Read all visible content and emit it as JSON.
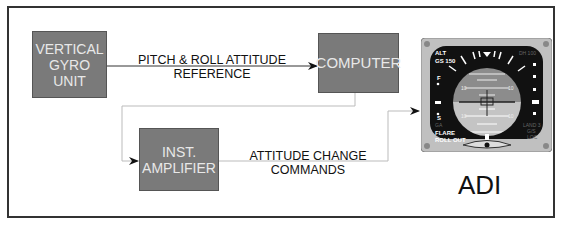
{
  "diagram": {
    "blocks": [
      {
        "id": "vgu",
        "label": "VERTICAL\nGYRO\nUNIT"
      },
      {
        "id": "computer",
        "label": "COMPUTER"
      },
      {
        "id": "amplifier",
        "label": "INST.\nAMPLIFIER"
      }
    ],
    "connections": [
      {
        "from": "vgu",
        "to": "computer",
        "label": "PITCH & ROLL ATTITUDE\nREFERENCE"
      },
      {
        "from": "computer",
        "to": "amplifier",
        "label": ""
      },
      {
        "from": "amplifier",
        "to": "adi",
        "label": "ATTITUDE CHANGE\nCOMMANDS"
      }
    ],
    "instrument": {
      "id": "adi",
      "label": "ADI",
      "readouts": {
        "top_left_1": "ALT",
        "top_left_2": "GS 150",
        "left_f": "F",
        "left_s": "S",
        "left_ga": "GA",
        "bottom_left_1": "FLARE",
        "bottom_left_2": "ROLL OUT",
        "top_right": "DH 100",
        "right_1": "LAND 3",
        "right_2": "G/S",
        "right_3": "LOC",
        "pitch_upper": "10",
        "pitch_lower": "10"
      }
    }
  },
  "colors": {
    "block_fill": "#7a7a7a",
    "block_text": "#e8e8e8",
    "sky": "#8c8c8c",
    "ground": "#c4c4c4",
    "bezel": "#bdbdbd",
    "face": "#111111"
  }
}
